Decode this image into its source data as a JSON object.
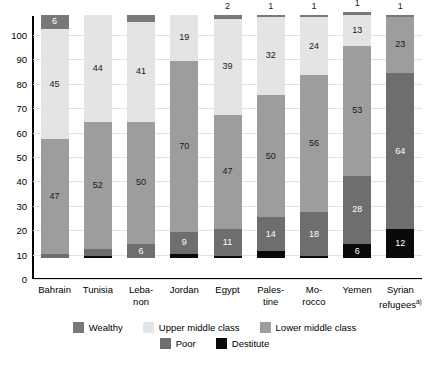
{
  "chart_data": {
    "type": "bar",
    "subtype": "stacked-bar-100",
    "title": "",
    "subtitle": "",
    "xlabel": "",
    "ylabel": "",
    "ylim": [
      0,
      100
    ],
    "yticks": [
      0,
      10,
      20,
      30,
      40,
      50,
      60,
      70,
      80,
      90,
      100
    ],
    "grid": true,
    "legend_position": "bottom",
    "categories": [
      "Bahrain",
      "Tunisia",
      "Leba-\nnon",
      "Jordan",
      "Egypt",
      "Pales-\ntine",
      "Mo-\nrocco",
      "Yemen",
      "Syrian\nrefugees"
    ],
    "series": [
      {
        "name": "Destitute",
        "color": "#0a0a0a",
        "values": [
          0,
          1,
          0,
          2,
          1,
          3,
          1,
          6,
          12
        ]
      },
      {
        "name": "Poor",
        "color": "#6e6e6e",
        "values": [
          2,
          3,
          6,
          9,
          11,
          14,
          18,
          28,
          64
        ]
      },
      {
        "name": "Lower middle class",
        "color": "#9d9d9d",
        "values": [
          47,
          52,
          50,
          70,
          47,
          50,
          56,
          53,
          23
        ]
      },
      {
        "name": "Upper middle class",
        "color": "#e4e4e4",
        "values": [
          45,
          44,
          41,
          19,
          39,
          32,
          24,
          13,
          0
        ]
      },
      {
        "name": "Wealthy",
        "color": "#787878",
        "values": [
          6,
          0,
          3,
          0,
          2,
          1,
          1,
          1,
          1
        ]
      }
    ],
    "above_bar_labels": [
      "",
      "",
      "",
      "",
      "2",
      "1",
      "1",
      "1",
      "1"
    ],
    "notes": {
      "syrian_refugees_footnote_marker": "a)"
    }
  },
  "legend": {
    "rows": [
      [
        {
          "label": "Wealthy",
          "color": "#787878"
        },
        {
          "label": "Upper middle class",
          "color": "#e4e4e4"
        },
        {
          "label": "Lower middle class",
          "color": "#9d9d9d"
        }
      ],
      [
        {
          "label": "Poor",
          "color": "#6e6e6e"
        },
        {
          "label": "Destitute",
          "color": "#0a0a0a"
        }
      ]
    ]
  },
  "axis": {
    "y_tick_labels": [
      "100",
      "90",
      "80",
      "70",
      "60",
      "50",
      "40",
      "30",
      "20",
      "10",
      "0"
    ]
  },
  "x_axis_labels": [
    {
      "line1": "Bahrain",
      "line2": ""
    },
    {
      "line1": "Tunisia",
      "line2": ""
    },
    {
      "line1": "Leba-",
      "line2": "non"
    },
    {
      "line1": "Jordan",
      "line2": ""
    },
    {
      "line1": "Egypt",
      "line2": ""
    },
    {
      "line1": "Pales-",
      "line2": "tine"
    },
    {
      "line1": "Mo-",
      "line2": "rocco"
    },
    {
      "line1": "Yemen",
      "line2": ""
    },
    {
      "line1": "Syrian",
      "line2": "refugees",
      "sup": "a)"
    }
  ],
  "colors": {
    "wealthy": "#787878",
    "upper_middle": "#e4e4e4",
    "lower_middle": "#9d9d9d",
    "poor": "#6e6e6e",
    "destitute": "#0a0a0a",
    "grid": "#e2e2e2",
    "axis": "#000000",
    "background": "#ffffff"
  }
}
